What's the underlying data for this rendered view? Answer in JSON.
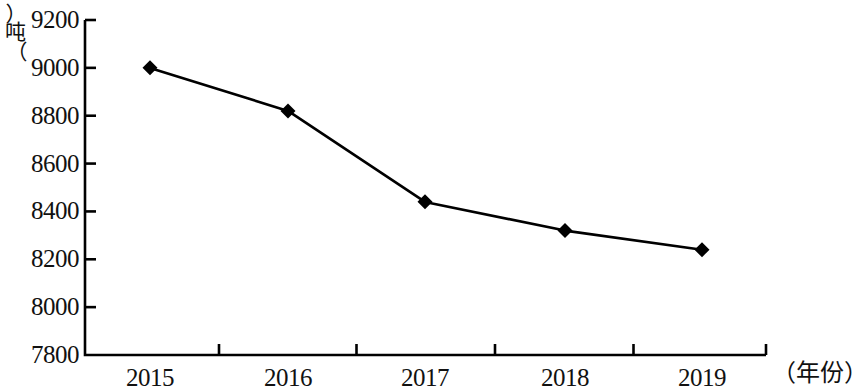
{
  "chart_data": {
    "type": "line",
    "title": "",
    "subtitle": "",
    "xlabel": "（年份）",
    "ylabel": "（吨）",
    "categories": [
      "2015",
      "2016",
      "2017",
      "2018",
      "2019"
    ],
    "values": [
      9000,
      8820,
      8440,
      8320,
      8240
    ],
    "series": [
      {
        "name": "",
        "values": [
          9000,
          8820,
          8440,
          8320,
          8240
        ]
      }
    ],
    "ylim": [
      7800,
      9200
    ],
    "ytick_labels": [
      "9200",
      "9000",
      "8800",
      "8600",
      "8400",
      "8200",
      "8000",
      "7800"
    ],
    "ytick_values": [
      9200,
      9000,
      8800,
      8600,
      8400,
      8200,
      8000,
      7800
    ],
    "ytick_step": 200,
    "xtick_labels": [
      "2015",
      "2016",
      "2017",
      "2018",
      "2019"
    ],
    "grid": false,
    "legend": false,
    "legend_position": "none",
    "marker": "diamond",
    "line_color": "#000000",
    "marker_color": "#000000",
    "axis_color": "#000000",
    "background_color": "#ffffff",
    "annotations": []
  },
  "axis": {
    "y_caption_open": "︵",
    "y_caption_unit": "吨",
    "y_caption_close": "︶",
    "x_caption": "（年份）"
  }
}
